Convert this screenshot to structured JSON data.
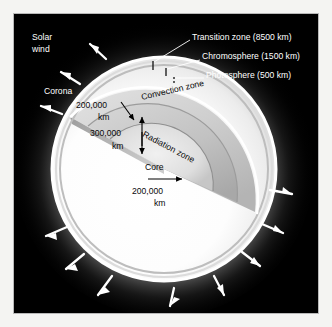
{
  "figure": {
    "background_color": "#000000",
    "glow_color": "#ffffff"
  },
  "outer_labels": {
    "solar_wind_line1": "Solar",
    "solar_wind_line2": "wind",
    "corona": "Corona"
  },
  "callouts": [
    {
      "label": "Transition zone (8500 km)"
    },
    {
      "label": "Chromosphere (1500 km)"
    },
    {
      "label": "Photosphere (500 km)"
    }
  ],
  "zones": {
    "convection": "Convection zone",
    "radiation": "Radiation zone",
    "core": "Core"
  },
  "dimensions": [
    {
      "value": "200,000",
      "unit": "km"
    },
    {
      "value": "300,000",
      "unit": "km"
    },
    {
      "value": "200,000",
      "unit": "km"
    }
  ],
  "solar_wind_arrows": {
    "count": 11,
    "color": "#ffffff",
    "description": "radial arrows pointing outward from the corona"
  }
}
